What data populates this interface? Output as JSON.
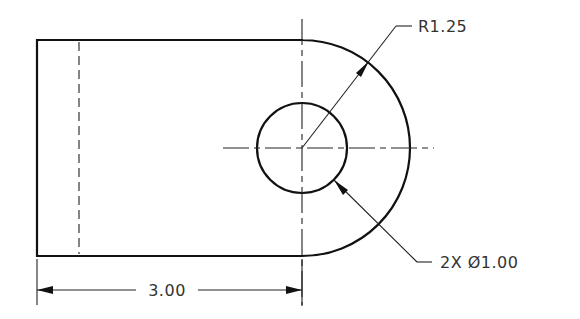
{
  "drawing": {
    "type": "engineering-orthographic-view",
    "part": "rounded link plate with hole",
    "stroke_color": "#111111",
    "background": "#ffffff"
  },
  "annotations": {
    "radius_label": "R1.25",
    "hole_label": "2X Ø1.00",
    "length_label": "3.00"
  },
  "dimensions": {
    "outer_radius": 1.25,
    "hole_diameter": 1.0,
    "hole_count": 2,
    "length_to_center": 3.0
  }
}
